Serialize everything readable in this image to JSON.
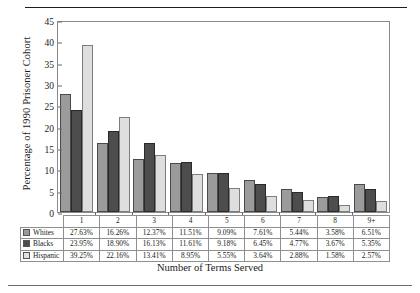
{
  "chart_data": {
    "type": "bar",
    "title": "",
    "xlabel": "Number of Terms Served",
    "ylabel": "Percentage of 1990 Prisoner Cohort",
    "categories": [
      "1",
      "2",
      "3",
      "4",
      "5",
      "6",
      "7",
      "8",
      "9+"
    ],
    "ylim": [
      0,
      45
    ],
    "yticks": [
      0,
      5,
      10,
      15,
      20,
      25,
      30,
      35,
      40,
      45
    ],
    "grid": false,
    "legend_position": "table-below",
    "series": [
      {
        "name": "Whites",
        "color": "#9b9b9b",
        "values": [
          27.63,
          16.26,
          12.37,
          11.51,
          9.09,
          7.61,
          5.44,
          3.58,
          6.51
        ],
        "labels": [
          "27.63%",
          "16.26%",
          "12.37%",
          "11.51%",
          "9.09%",
          "7.61%",
          "5.44%",
          "3.58%",
          "6.51%"
        ]
      },
      {
        "name": "Blacks",
        "color": "#4d4d4d",
        "values": [
          23.95,
          18.9,
          16.13,
          11.61,
          9.18,
          6.45,
          4.77,
          3.67,
          5.35
        ],
        "labels": [
          "23.95%",
          "18.90%",
          "16.13%",
          "11.61%",
          "9.18%",
          "6.45%",
          "4.77%",
          "3.67%",
          "5.35%"
        ]
      },
      {
        "name": "Hispanic",
        "color": "#dedede",
        "values": [
          39.25,
          22.16,
          13.41,
          8.95,
          5.55,
          3.64,
          2.88,
          1.58,
          2.57
        ],
        "labels": [
          "39.25%",
          "22.16%",
          "13.41%",
          "8.95%",
          "5.55%",
          "3.64%",
          "2.88%",
          "1.58%",
          "2.57%"
        ]
      }
    ]
  }
}
